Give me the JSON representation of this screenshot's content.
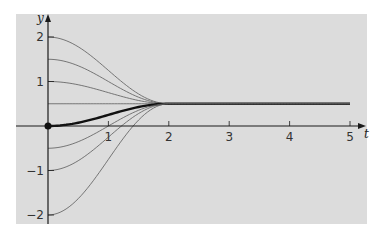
{
  "chart_data": {
    "type": "line",
    "title": "",
    "xlabel": "t",
    "ylabel": "y",
    "xlim": [
      0,
      5
    ],
    "ylim": [
      -2,
      2
    ],
    "grid": false,
    "legend": null,
    "x_ticks": [
      1,
      2,
      3,
      4,
      5
    ],
    "x_tick_labels": [
      "1",
      "2",
      "3",
      "4",
      "5"
    ],
    "y_ticks": [
      2,
      1,
      -1,
      -2
    ],
    "y_tick_labels": [
      "2",
      "1",
      "−1",
      "−2"
    ],
    "equilibrium": 0.5,
    "settle_time": 2,
    "series": [
      {
        "name": "y0=2",
        "initial": 2,
        "style": "thin",
        "x": [
          0,
          0.5,
          1,
          1.5,
          2,
          5
        ],
        "y": [
          2,
          1.78,
          1.25,
          0.72,
          0.5,
          0.5
        ]
      },
      {
        "name": "y0=1.5",
        "initial": 1.5,
        "style": "thin",
        "x": [
          0,
          0.5,
          1,
          1.5,
          2,
          5
        ],
        "y": [
          1.5,
          1.35,
          1.0,
          0.65,
          0.5,
          0.5
        ]
      },
      {
        "name": "y0=1",
        "initial": 1,
        "style": "thin",
        "x": [
          0,
          0.5,
          1,
          1.5,
          2,
          5
        ],
        "y": [
          1,
          0.93,
          0.75,
          0.57,
          0.5,
          0.5
        ]
      },
      {
        "name": "y0=0.5",
        "initial": 0.5,
        "style": "thin",
        "x": [
          0,
          5
        ],
        "y": [
          0.5,
          0.5
        ]
      },
      {
        "name": "y0=0",
        "initial": 0,
        "style": "thick",
        "x": [
          0,
          0.5,
          1,
          1.5,
          2,
          5
        ],
        "y": [
          0,
          0.07,
          0.25,
          0.43,
          0.5,
          0.5
        ]
      },
      {
        "name": "y0=-0.5",
        "initial": -0.5,
        "style": "thin",
        "x": [
          0,
          0.5,
          1,
          1.5,
          2,
          5
        ],
        "y": [
          -0.5,
          -0.35,
          0.0,
          0.35,
          0.5,
          0.5
        ]
      },
      {
        "name": "y0=-1",
        "initial": -1,
        "style": "thin",
        "x": [
          0,
          0.5,
          1,
          1.5,
          2,
          5
        ],
        "y": [
          -1,
          -0.78,
          -0.25,
          0.28,
          0.5,
          0.5
        ]
      },
      {
        "name": "y0=-2",
        "initial": -2,
        "style": "thin",
        "x": [
          0,
          0.5,
          1,
          1.5,
          2,
          5
        ],
        "y": [
          -2,
          -1.63,
          -0.75,
          0.13,
          0.5,
          0.5
        ]
      }
    ],
    "annotations": [
      {
        "type": "point",
        "x": 0,
        "y": 0,
        "label": ""
      }
    ]
  },
  "colors": {
    "background": "#ffffff",
    "plot_background": "#dcdcdc",
    "axis": "#1a1a1a",
    "thin_curve": "#5a5a5a",
    "thick_curve": "#111111"
  }
}
